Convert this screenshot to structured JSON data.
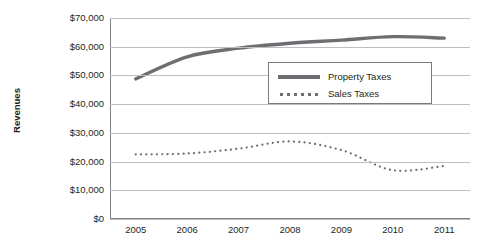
{
  "chart_data": {
    "type": "line",
    "title": "",
    "xlabel": "",
    "ylabel": "Revenues",
    "x": [
      2005,
      2006,
      2007,
      2008,
      2009,
      2010,
      2011
    ],
    "categories": [
      "2005",
      "2006",
      "2007",
      "2008",
      "2009",
      "2010",
      "2011"
    ],
    "series": [
      {
        "name": "Property Taxes",
        "style": "solid",
        "color": "#6d6e71",
        "values": [
          48800,
          56500,
          59500,
          61200,
          62300,
          63500,
          63000
        ]
      },
      {
        "name": "Sales Taxes",
        "style": "dotted",
        "color": "#6d6e71",
        "values": [
          22500,
          22800,
          24500,
          27000,
          24000,
          17000,
          18500
        ]
      }
    ],
    "ylim": [
      0,
      70000
    ],
    "yticks": [
      0,
      10000,
      20000,
      30000,
      40000,
      50000,
      60000,
      70000
    ],
    "ytick_labels": [
      "$0",
      "$10,000",
      "$20,000",
      "$30,000",
      "$40,000",
      "$50,000",
      "$60,000",
      "$70,000"
    ],
    "grid": true,
    "legend_position": "upper-center-right"
  },
  "axes": {
    "y_title": "Revenues",
    "y_ticks": [
      {
        "label": "$70,000",
        "value": 70000
      },
      {
        "label": "$60,000",
        "value": 60000
      },
      {
        "label": "$50,000",
        "value": 50000
      },
      {
        "label": "$40,000",
        "value": 40000
      },
      {
        "label": "$30,000",
        "value": 30000
      },
      {
        "label": "$20,000",
        "value": 20000
      },
      {
        "label": "$10,000",
        "value": 10000
      },
      {
        "label": "$0",
        "value": 0
      }
    ],
    "x_ticks": [
      {
        "label": "2005",
        "value": 2005
      },
      {
        "label": "2006",
        "value": 2006
      },
      {
        "label": "2007",
        "value": 2007
      },
      {
        "label": "2008",
        "value": 2008
      },
      {
        "label": "2009",
        "value": 2009
      },
      {
        "label": "2010",
        "value": 2010
      },
      {
        "label": "2011",
        "value": 2011
      }
    ]
  },
  "legend": {
    "entries": [
      {
        "label": "Property Taxes",
        "style": "solid"
      },
      {
        "label": "Sales Taxes",
        "style": "dotted"
      }
    ]
  },
  "colors": {
    "line": "#6d6e71",
    "gridline": "#bcbec0",
    "axis": "#808285",
    "text": "#231f20",
    "background": "#ffffff"
  }
}
